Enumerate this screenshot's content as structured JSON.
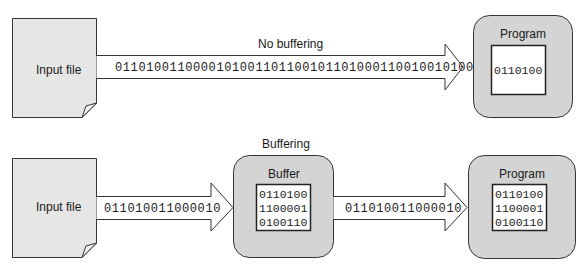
{
  "colors": {
    "file_fill": "#e6e6e6",
    "box_fill": "#d4d4d4",
    "inner_fill": "#ffffff",
    "arrow_fill": "#ffffff",
    "stroke": "#333333"
  },
  "top": {
    "section_label": "No buffering",
    "input_file_label": "Input file",
    "stream": "0110100110000101001101100101101000110010010100",
    "program": {
      "title": "Program",
      "lines": [
        "0110100"
      ]
    }
  },
  "bottom": {
    "section_label": "Buffering",
    "input_file_label": "Input file",
    "stream_in": "011010011000010",
    "buffer": {
      "title": "Buffer",
      "lines": [
        "0110100",
        "1100001",
        "0100110"
      ]
    },
    "stream_out": "011010011000010",
    "program": {
      "title": "Program",
      "lines": [
        "0110100",
        "1100001",
        "0100110"
      ]
    }
  }
}
